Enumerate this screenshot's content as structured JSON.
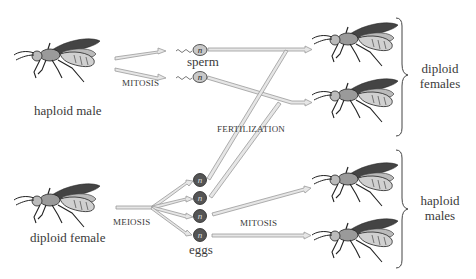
{
  "diagram": {
    "parents": {
      "male": "haploid male",
      "female": "diploid female"
    },
    "processes": {
      "male_mitosis": "MITOSIS",
      "female_meiosis": "MEIOSIS",
      "fertilization": "FERTILIZATION",
      "egg_mitosis": "MITOSIS"
    },
    "gametes": {
      "sperm_label": "sperm",
      "eggs_label": "eggs",
      "ploidy_symbol": "n",
      "sperm_count": 2,
      "egg_count": 4
    },
    "offspring": {
      "group1_line1": "diploid",
      "group1_line2": "females",
      "group2_line1": "haploid",
      "group2_line2": "males"
    },
    "colors": {
      "arrow_fill": "#e6e6e6",
      "arrow_stroke": "#9a9a9a",
      "sperm_fill": "#c8c8c8",
      "egg_fill": "#555555",
      "text": "#3a3a3a"
    }
  }
}
